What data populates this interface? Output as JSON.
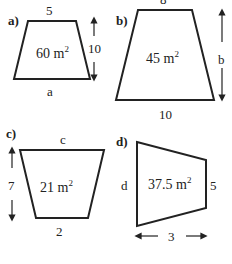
{
  "figures": [
    {
      "part": "a)",
      "area": "60 m",
      "sup": "2",
      "top": "5",
      "height": "10",
      "bottom": "a"
    },
    {
      "part": "b)",
      "area": "45 m",
      "sup": "2",
      "top": "8",
      "height": "b",
      "bottom": "10"
    },
    {
      "part": "c)",
      "area": "21 m",
      "sup": "2",
      "top": "c",
      "height": "7",
      "bottom": "2"
    },
    {
      "part": "d)",
      "area": "37.5 m",
      "sup": "2",
      "left": "d",
      "right": "5",
      "width": "3"
    }
  ]
}
